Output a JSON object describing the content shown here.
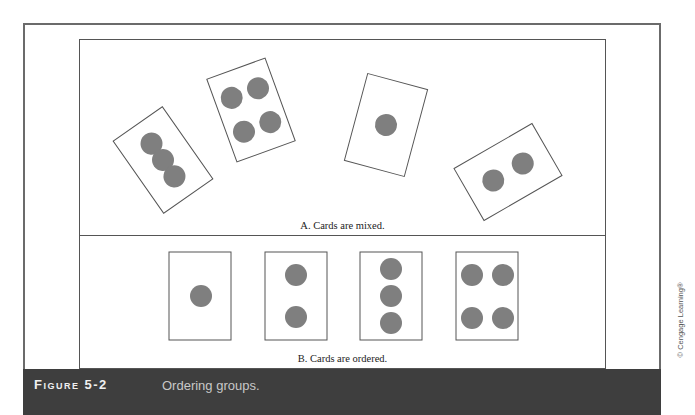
{
  "figure": {
    "number_label": "Figure 5-2",
    "caption": "Ordering groups.",
    "credit": "© Cengage Learning®"
  },
  "panels": {
    "a": {
      "label": "A. Cards are mixed.",
      "cards": [
        {
          "dots": 3,
          "rotation_deg": -35
        },
        {
          "dots": 4,
          "rotation_deg": -20
        },
        {
          "dots": 1,
          "rotation_deg": 15
        },
        {
          "dots": 2,
          "rotation_deg": -30
        }
      ]
    },
    "b": {
      "label": "B. Cards are ordered.",
      "cards": [
        {
          "dots": 1
        },
        {
          "dots": 2
        },
        {
          "dots": 3
        },
        {
          "dots": 4
        }
      ]
    }
  },
  "colors": {
    "dot": "#7f7f7f",
    "card_border": "#555555",
    "caption_bar": "#3e3e3e"
  }
}
